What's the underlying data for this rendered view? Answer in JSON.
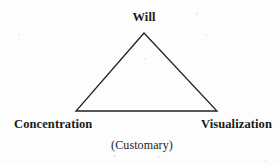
{
  "diagram": {
    "type": "triangle-diagram",
    "caption": "(Customary)",
    "vertices": [
      {
        "id": "apex",
        "label": "Will",
        "x": 144,
        "y": 33
      },
      {
        "id": "bottom-left",
        "label": "Concentration",
        "x": 76,
        "y": 111
      },
      {
        "id": "bottom-right",
        "label": "Visualization",
        "x": 217,
        "y": 111
      }
    ],
    "edges": [
      {
        "from": "apex",
        "to": "bottom-left"
      },
      {
        "from": "apex",
        "to": "bottom-right"
      },
      {
        "from": "bottom-left",
        "to": "bottom-right"
      }
    ],
    "style": {
      "stroke_color": "#231f20",
      "stroke_width": 1.3,
      "background_color": "#fdfdfd",
      "text_color": "#1a1a1a"
    }
  }
}
